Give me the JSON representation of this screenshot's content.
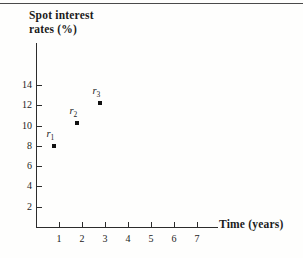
{
  "figure": {
    "y_axis_title_line1": "Spot  interest",
    "y_axis_title_line2": "rates  (%)",
    "x_axis_title": "Time  (years)"
  },
  "chart_data": {
    "type": "scatter",
    "title": "",
    "subtitle": "",
    "xlabel": "Time (years)",
    "ylabel": "Spot interest rates (%)",
    "xlim": [
      0,
      7.6
    ],
    "ylim": [
      0,
      16
    ],
    "grid": false,
    "legend": null,
    "xticks": [
      "1",
      "2",
      "3",
      "4",
      "5",
      "6",
      "7"
    ],
    "xtick_values": [
      1,
      2,
      3,
      4,
      5,
      6,
      7
    ],
    "yticks": [
      "2",
      "4",
      "6",
      "8",
      "10",
      "12",
      "14"
    ],
    "ytick_values": [
      2,
      4,
      6,
      8,
      10,
      12,
      14
    ],
    "points": [
      {
        "label": "r",
        "sub": "1",
        "x": 0.8,
        "y": 8.0
      },
      {
        "label": "r",
        "sub": "2",
        "x": 1.8,
        "y": 10.2
      },
      {
        "label": "r",
        "sub": "3",
        "x": 2.8,
        "y": 12.2
      }
    ],
    "marker": "square",
    "marker_color": "#111111",
    "axis_color": "#2c2c2c",
    "background_color": "#fefefd"
  }
}
